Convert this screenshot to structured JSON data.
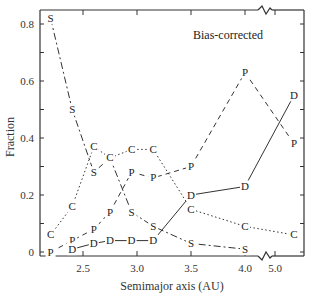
{
  "chart_data": {
    "type": "line",
    "title": "",
    "annotation": "Bias-corrected",
    "xlabel": "Semimajor axis (AU)",
    "ylabel": "Fraction",
    "xticks": [
      "2.5",
      "3.0",
      "3.5",
      "4.0",
      "5.0"
    ],
    "yticks": [
      "0",
      "0.2",
      "0.4",
      "0.6",
      "0.8"
    ],
    "ylim": [
      0,
      0.85
    ],
    "x_axis_break": "between 4.0 and 5.0",
    "grid": false,
    "legend": "none (series identified by letter markers S, C, P, D)",
    "x": [
      2.2,
      2.4,
      2.6,
      2.75,
      2.95,
      3.15,
      3.5,
      4.0,
      5.2
    ],
    "series": [
      {
        "name": "S",
        "style": "dash-dot",
        "x": [
          2.2,
          2.4,
          2.6,
          2.75,
          2.95,
          3.15,
          3.5,
          4.0
        ],
        "values": [
          0.82,
          0.5,
          0.28,
          0.33,
          0.14,
          0.09,
          0.03,
          0.01
        ]
      },
      {
        "name": "C",
        "style": "dotted",
        "x": [
          2.2,
          2.4,
          2.6,
          2.75,
          2.95,
          3.15,
          3.5,
          4.0,
          5.2
        ],
        "values": [
          0.06,
          0.16,
          0.37,
          0.33,
          0.36,
          0.36,
          0.15,
          0.09,
          0.06
        ]
      },
      {
        "name": "P",
        "style": "dashed",
        "x": [
          2.2,
          2.4,
          2.6,
          2.75,
          2.95,
          3.15,
          3.5,
          4.0,
          5.2
        ],
        "values": [
          0.0,
          0.04,
          0.08,
          0.14,
          0.28,
          0.26,
          0.3,
          0.63,
          0.38
        ]
      },
      {
        "name": "D",
        "style": "solid",
        "x": [
          2.4,
          2.6,
          2.75,
          2.95,
          3.15,
          3.5,
          4.0,
          5.2
        ],
        "values": [
          0.01,
          0.03,
          0.04,
          0.04,
          0.04,
          0.2,
          0.23,
          0.55
        ]
      }
    ]
  },
  "labels": {
    "annotation": "Bias-corrected",
    "xlabel": "Semimajor axis (AU)",
    "ylabel": "Fraction",
    "xticks": [
      "2.5",
      "3.0",
      "3.5",
      "4.0",
      "5.0"
    ],
    "yticks": [
      "0",
      "0.2",
      "0.4",
      "0.6",
      "0.8"
    ]
  }
}
